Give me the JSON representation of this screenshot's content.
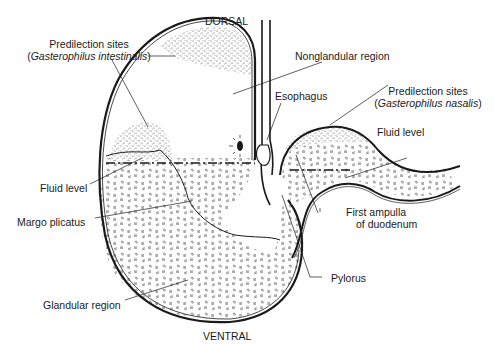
{
  "diagram": {
    "orientation": {
      "top": "DORSAL",
      "bottom": "VENTRAL"
    },
    "labels": {
      "predilection_intestinalis": {
        "line1": "Predilection sites",
        "open_paren": "(",
        "species": "Gasterophilus intestinalis",
        "close_paren": ")"
      },
      "nonglandular_region": "Nonglandular region",
      "esophagus": "Esophagus",
      "predilection_nasalis": {
        "line1": "Predilection sites",
        "open_paren": "(",
        "species": "Gasterophilus nasalis",
        "close_paren": ")"
      },
      "fluid_level_right": "Fluid level",
      "fluid_level_left": "Fluid level",
      "margo_plicatus": "Margo plicatus",
      "first_ampulla": {
        "line1": "First ampulla",
        "line2": "of duodenum"
      },
      "pylorus": "Pylorus",
      "glandular_region": "Glandular region"
    },
    "colors": {
      "outline": "#1a1a1a",
      "stipple": "#555555",
      "background": "#ffffff"
    }
  }
}
